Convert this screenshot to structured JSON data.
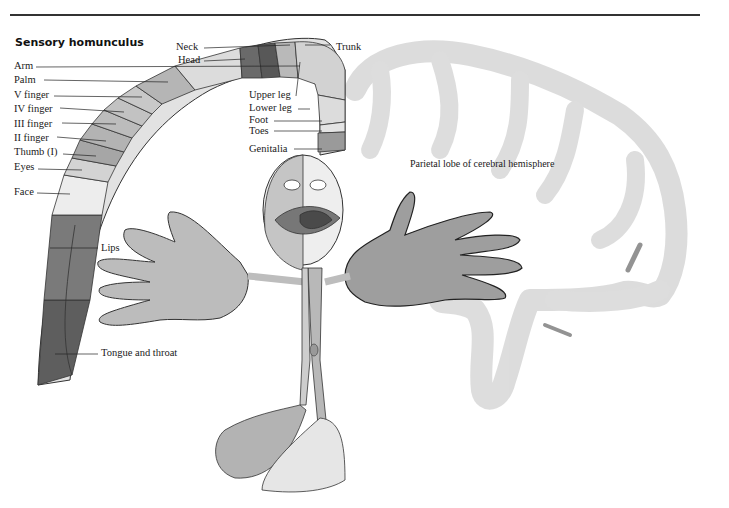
{
  "figure": {
    "title": "Sensory homunculus",
    "region_label": "Parietal lobe of cerebral hemisphere"
  },
  "labels": {
    "neck": "Neck",
    "head": "Head",
    "trunk": "Trunk",
    "arm": "Arm",
    "palm": "Palm",
    "v_finger": "V finger",
    "iv_finger": "IV  finger",
    "iii_finger": "III  finger",
    "ii_finger": "II  finger",
    "thumb": "Thumb (I)",
    "eyes": "Eyes",
    "face": "Face",
    "lips": "Lips",
    "tongue": "Tongue and throat",
    "upper_leg": "Upper leg",
    "lower_leg": "Lower leg",
    "foot": "Foot",
    "toes": "Toes",
    "genitalia": "Genitalia"
  },
  "colors": {
    "rule": "#333333",
    "strip_light": "#e6e6e6",
    "strip_mid": "#bdbdbd",
    "strip_dark": "#6e6e6e",
    "lips_region": "#7a7a7a",
    "tongue_region": "#5e5e5e",
    "hand": "#bcbcbc",
    "brain": "#dcdcdc"
  }
}
